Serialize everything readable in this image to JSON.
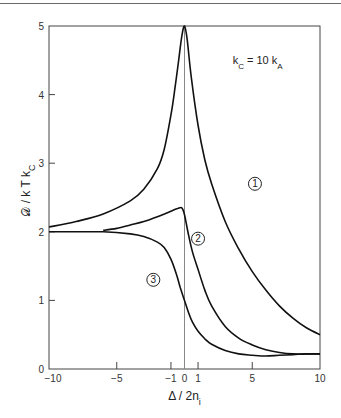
{
  "chart_data": {
    "type": "line",
    "title": "",
    "xlabel": "Δ / 2n_i",
    "ylabel": "𝒟 / kTk_C",
    "xlim": [
      -10,
      10
    ],
    "ylim": [
      0,
      5
    ],
    "xticks": [
      -10,
      -5,
      -1,
      0,
      1,
      5,
      10
    ],
    "yticks": [
      0,
      1,
      2,
      3,
      4,
      5
    ],
    "grid": false,
    "legend": "none (curves labeled inline with circled numbers)",
    "annotations": [
      {
        "text": "k_C = 10 k_A",
        "x": 4.0,
        "y": 4.5
      },
      {
        "text": "①",
        "x": 5.2,
        "y": 2.7
      },
      {
        "text": "②",
        "x": 1.0,
        "y": 1.9
      },
      {
        "text": "③",
        "x": -2.3,
        "y": 1.3
      }
    ],
    "reference_line": {
      "x": 0,
      "orientation": "vertical"
    },
    "series": [
      {
        "name": "1",
        "x": [
          -10,
          -8,
          -6,
          -4,
          -3,
          -2,
          -1.5,
          -1,
          -0.7,
          -0.4,
          -0.2,
          0,
          0.2,
          0.5,
          1,
          1.5,
          2,
          3,
          4,
          5,
          6,
          7,
          8,
          9,
          10
        ],
        "y": [
          2.07,
          2.15,
          2.26,
          2.45,
          2.62,
          2.92,
          3.2,
          3.7,
          4.1,
          4.55,
          4.85,
          5.0,
          4.8,
          4.25,
          3.55,
          3.05,
          2.7,
          2.15,
          1.75,
          1.42,
          1.15,
          0.92,
          0.74,
          0.6,
          0.5
        ]
      },
      {
        "name": "2",
        "x": [
          -6,
          -5,
          -4,
          -3,
          -2,
          -1,
          -0.5,
          -0.2,
          0,
          0.3,
          0.6,
          1,
          1.5,
          2,
          3,
          4,
          5,
          6,
          7,
          8,
          9,
          10
        ],
        "y": [
          2.02,
          2.05,
          2.1,
          2.15,
          2.22,
          2.3,
          2.34,
          2.35,
          2.25,
          1.95,
          1.7,
          1.45,
          1.15,
          0.92,
          0.62,
          0.45,
          0.35,
          0.28,
          0.24,
          0.22,
          0.22,
          0.22
        ]
      },
      {
        "name": "3",
        "x": [
          -10,
          -8,
          -6,
          -4,
          -3,
          -2,
          -1.5,
          -1,
          -0.6,
          -0.3,
          0,
          0.3,
          0.6,
          1,
          1.5,
          2,
          3,
          4,
          5,
          6,
          7,
          8,
          9,
          10
        ],
        "y": [
          2.0,
          2.0,
          2.0,
          1.97,
          1.93,
          1.85,
          1.77,
          1.6,
          1.38,
          1.18,
          1.0,
          0.82,
          0.68,
          0.55,
          0.44,
          0.36,
          0.27,
          0.22,
          0.2,
          0.19,
          0.2,
          0.21,
          0.22,
          0.22
        ]
      }
    ]
  }
}
